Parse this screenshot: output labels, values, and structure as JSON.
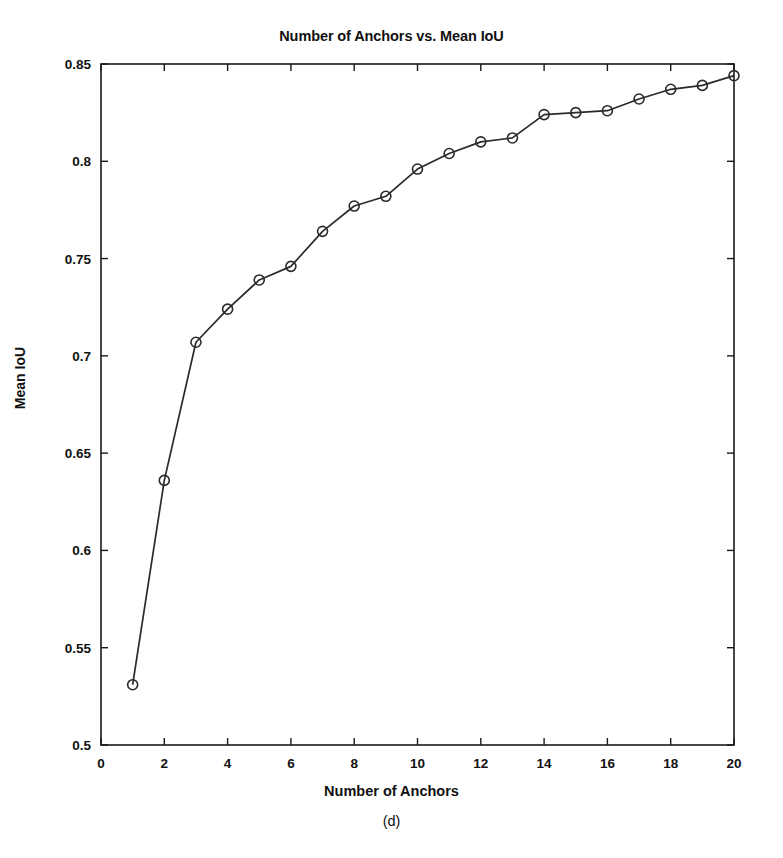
{
  "figure": {
    "title": "Number of Anchors vs. Mean IoU",
    "subcaption": "(d)",
    "background_color": "#ffffff",
    "line_color": "#2a2a2a",
    "axis_color": "#1a1a1a"
  },
  "chart_data": {
    "type": "line",
    "title": "Number of Anchors vs. Mean IoU",
    "xlabel": "Number of Anchors",
    "ylabel": "Mean IoU",
    "xlim": [
      0,
      20
    ],
    "ylim": [
      0.5,
      0.85
    ],
    "xticks": [
      0,
      2,
      4,
      6,
      8,
      10,
      12,
      14,
      16,
      18,
      20
    ],
    "xticklabels": [
      "0",
      "2",
      "4",
      "6",
      "8",
      "10",
      "12",
      "14",
      "16",
      "18",
      "20"
    ],
    "yticks": [
      0.5,
      0.55,
      0.6,
      0.65,
      0.7,
      0.75,
      0.8,
      0.85
    ],
    "yticklabels": [
      "0.5",
      "0.55",
      "0.6",
      "0.65",
      "0.7",
      "0.75",
      "0.8",
      "0.85"
    ],
    "grid": false,
    "legend": null,
    "marker": "circle-open",
    "x": [
      1,
      2,
      3,
      4,
      5,
      6,
      7,
      8,
      9,
      10,
      11,
      12,
      13,
      14,
      15,
      16,
      17,
      18,
      19,
      20
    ],
    "values": [
      0.531,
      0.636,
      0.707,
      0.724,
      0.739,
      0.746,
      0.764,
      0.777,
      0.782,
      0.796,
      0.804,
      0.81,
      0.812,
      0.824,
      0.825,
      0.826,
      0.832,
      0.837,
      0.839,
      0.844
    ],
    "series": [
      {
        "name": "Mean IoU",
        "values": [
          0.531,
          0.636,
          0.707,
          0.724,
          0.739,
          0.746,
          0.764,
          0.777,
          0.782,
          0.796,
          0.804,
          0.81,
          0.812,
          0.824,
          0.825,
          0.826,
          0.832,
          0.837,
          0.839,
          0.844
        ]
      }
    ]
  }
}
